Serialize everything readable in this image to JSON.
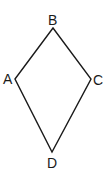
{
  "diagram": {
    "type": "quadrilateral",
    "shape": "kite",
    "stroke_color": "#1a1a1a",
    "vertices": [
      {
        "label": "A",
        "x": 15,
        "y": 79
      },
      {
        "label": "B",
        "x": 53,
        "y": 28
      },
      {
        "label": "C",
        "x": 91,
        "y": 79
      },
      {
        "label": "D",
        "x": 52,
        "y": 152
      }
    ],
    "labels": {
      "A": "A",
      "B": "B",
      "C": "C",
      "D": "D"
    }
  }
}
